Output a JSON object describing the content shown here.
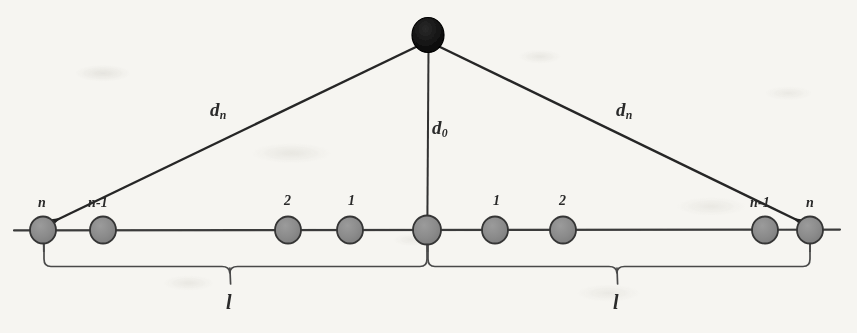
{
  "figure": {
    "type": "schematic-diagram",
    "background_color": "#f6f5f1",
    "ink_color": "#2a2a2a",
    "node_fill_color": "#8b8b8b",
    "node_stroke_color": "#3a3a3a",
    "apex_fill_color": "#111111"
  },
  "apex": {
    "name": "source-node",
    "x": 428,
    "y": 35,
    "radius": 16,
    "label": ""
  },
  "baseline": {
    "y": 230,
    "x_start": 14,
    "x_end": 840
  },
  "nodes": [
    {
      "label": "n",
      "x": 43,
      "y": 230,
      "r": 13,
      "side": "left"
    },
    {
      "label": "n-1",
      "x": 103,
      "y": 230,
      "r": 13,
      "side": "left"
    },
    {
      "label": "2",
      "x": 288,
      "y": 230,
      "r": 13,
      "side": "left"
    },
    {
      "label": "1",
      "x": 350,
      "y": 230,
      "r": 13,
      "side": "left"
    },
    {
      "label": "",
      "x": 427,
      "y": 230,
      "r": 14,
      "side": "center"
    },
    {
      "label": "1",
      "x": 495,
      "y": 230,
      "r": 13,
      "side": "right"
    },
    {
      "label": "2",
      "x": 563,
      "y": 230,
      "r": 13,
      "side": "right"
    },
    {
      "label": "n-1",
      "x": 765,
      "y": 230,
      "r": 13,
      "side": "right"
    },
    {
      "label": "n",
      "x": 810,
      "y": 230,
      "r": 13,
      "side": "right"
    }
  ],
  "distance_labels": [
    {
      "name": "d-n-left",
      "base": "d",
      "sub": "n",
      "x": 210,
      "y": 100
    },
    {
      "name": "d-zero",
      "base": "d",
      "sub": "0",
      "x": 432,
      "y": 118
    },
    {
      "name": "d-n-right",
      "base": "d",
      "sub": "n",
      "x": 616,
      "y": 100
    }
  ],
  "brace_labels": [
    {
      "name": "length-left",
      "text": "l",
      "x": 230,
      "y": 296
    },
    {
      "name": "length-right",
      "text": "l",
      "x": 617,
      "y": 296
    }
  ],
  "edges": {
    "ray_left": {
      "from": "apex",
      "to": "left-end-node",
      "arrow": true
    },
    "ray_right": {
      "from": "apex",
      "to": "right-end-node",
      "arrow": true
    },
    "drop": {
      "from": "apex",
      "to": "center-node",
      "arrow": false
    }
  },
  "braces": [
    {
      "name": "brace-left",
      "x_start": 43,
      "x_end": 427,
      "tip_x": 230,
      "top_y": 243,
      "bar_y": 266,
      "tip_y": 284
    },
    {
      "name": "brace-right",
      "x_start": 427,
      "x_end": 810,
      "tip_x": 617,
      "top_y": 243,
      "bar_y": 266,
      "tip_y": 284
    }
  ]
}
